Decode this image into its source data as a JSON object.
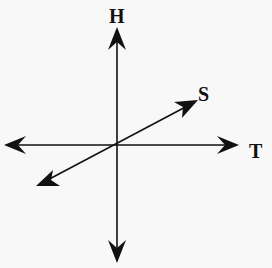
{
  "diagram": {
    "type": "three-axis-vector-diagram",
    "axes": [
      {
        "label": "H",
        "direction": "vertical",
        "positive_end": "top"
      },
      {
        "label": "T",
        "direction": "horizontal",
        "positive_end": "right"
      },
      {
        "label": "S",
        "direction": "diagonal",
        "positive_end": "upper-right"
      }
    ],
    "labels": {
      "h": "H",
      "t": "T",
      "s": "S"
    },
    "colors": {
      "line": "#111111",
      "background": "#f8f8f8"
    }
  }
}
